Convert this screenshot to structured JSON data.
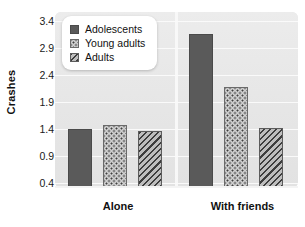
{
  "chart_data": {
    "type": "bar",
    "title": "",
    "xlabel": "",
    "ylabel": "Crashes",
    "categories": [
      "Alone",
      "With friends"
    ],
    "series": [
      {
        "name": "Adolescents",
        "values": [
          1.3,
          3.0
        ],
        "fill": "solid"
      },
      {
        "name": "Young adults",
        "values": [
          1.37,
          2.06
        ],
        "fill": "dots"
      },
      {
        "name": "Adults",
        "values": [
          1.26,
          1.32
        ],
        "fill": "hatch"
      }
    ],
    "ylim": [
      0.4,
      3.4
    ],
    "yticks": [
      "0.4",
      "0.9",
      "1.4",
      "1.9",
      "2.4",
      "2.9",
      "3.4"
    ],
    "grid": true,
    "legend_position": "top-left",
    "colors": {
      "adolescents": "#5a5a5a",
      "young_adults": "#cfcfcf",
      "adults": "#9a9a9a",
      "panel_background": "#e8e8e8",
      "gridline": "#fbfbfb",
      "text": "#111111"
    }
  }
}
